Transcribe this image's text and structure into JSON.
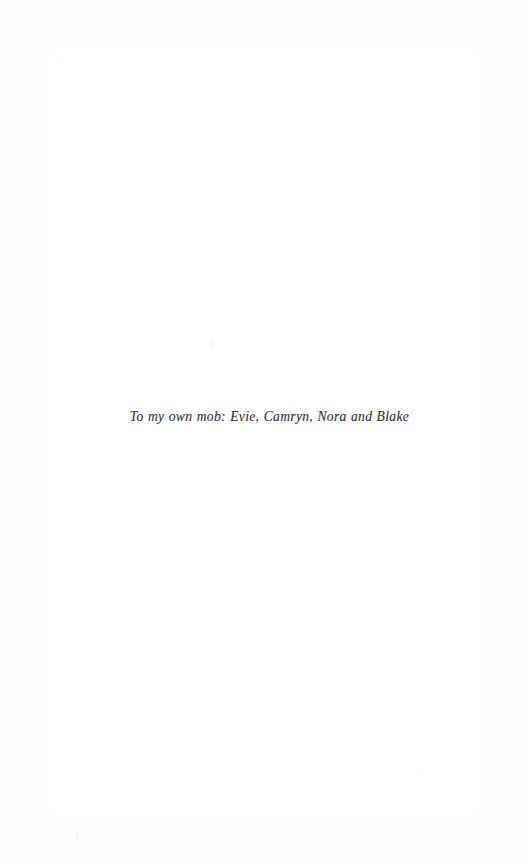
{
  "page": {
    "kind": "book-dedication-page",
    "width": 529,
    "height": 865,
    "background_color": "#fffffe",
    "text_color": "#2b2b2b"
  },
  "dedication": {
    "text": "To my own mob: Evie, Camryn, Nora and Blake"
  }
}
